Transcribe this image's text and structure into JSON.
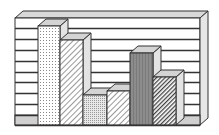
{
  "chart_data": {
    "type": "bar",
    "style": "3d-monochrome-patterned",
    "title": "",
    "xlabel": "",
    "ylabel": "",
    "categories": [
      "1",
      "2",
      "3",
      "4",
      "5",
      "6"
    ],
    "values": [
      8.8,
      7.6,
      2.7,
      3.0,
      6.4,
      4.3
    ],
    "ylim": [
      0,
      9
    ],
    "grid": true,
    "gridlines": 9,
    "legend": null,
    "tick_labels_visible": false,
    "patterns": [
      "fine-dots",
      "light-diagonal",
      "stipple",
      "light-diagonal",
      "dark-solid",
      "dense-diagonal"
    ]
  },
  "colors": {
    "outline": "#333333",
    "wall_face": "#ffffff",
    "wall_top": "#d9d9d9",
    "wall_side": "#e6e6e6",
    "floor_band": "#d0d0d0",
    "bar_top": "#d4d4d4",
    "bar_side": "#e3e3e3",
    "dark_bar": "#8c8c8c"
  }
}
